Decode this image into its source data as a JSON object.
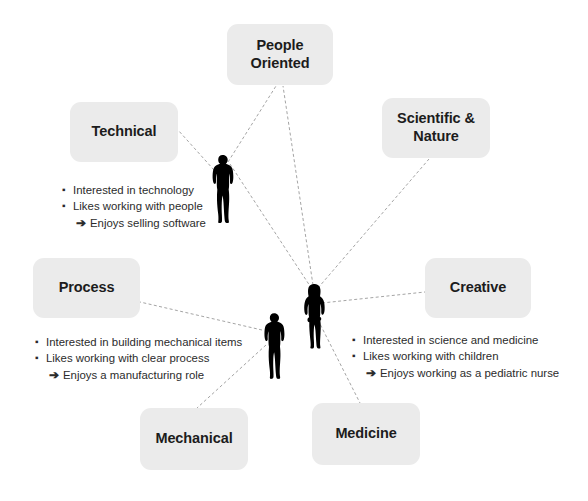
{
  "diagram": {
    "background_color": "#ffffff",
    "node_fill": "#ebebeb",
    "node_text_color": "#1c1c1c",
    "edge_color": "#9a9a9a",
    "figure_color": "#000000",
    "nodes": [
      {
        "id": "people-oriented",
        "label": "People\nOriented",
        "x": 227,
        "y": 24,
        "w": 106,
        "h": 61
      },
      {
        "id": "technical",
        "label": "Technical",
        "x": 70,
        "y": 102,
        "w": 108,
        "h": 60
      },
      {
        "id": "scientific-nature",
        "label": "Scientific &\nNature",
        "x": 382,
        "y": 98,
        "w": 108,
        "h": 60
      },
      {
        "id": "process",
        "label": "Process",
        "x": 33,
        "y": 258,
        "w": 107,
        "h": 60
      },
      {
        "id": "creative",
        "label": "Creative",
        "x": 425,
        "y": 258,
        "w": 106,
        "h": 60
      },
      {
        "id": "mechanical",
        "label": "Mechanical",
        "x": 140,
        "y": 408,
        "w": 108,
        "h": 62
      },
      {
        "id": "medicine",
        "label": "Medicine",
        "x": 312,
        "y": 403,
        "w": 108,
        "h": 62
      }
    ],
    "figures": [
      {
        "id": "man-top",
        "kind": "man",
        "x": 208,
        "y": 154,
        "w": 28,
        "h": 70
      },
      {
        "id": "man-bottom",
        "kind": "man",
        "x": 260,
        "y": 311,
        "w": 27,
        "h": 70
      },
      {
        "id": "woman",
        "kind": "woman",
        "x": 301,
        "y": 282,
        "w": 27,
        "h": 69
      }
    ],
    "edges": [
      {
        "id": "man-top-to-people",
        "x1": 228,
        "y1": 162,
        "x2": 276,
        "y2": 86
      },
      {
        "id": "man-top-to-technical",
        "x1": 214,
        "y1": 170,
        "x2": 178,
        "y2": 130
      },
      {
        "id": "man-top-to-woman-area",
        "x1": 230,
        "y1": 164,
        "x2": 310,
        "y2": 286
      },
      {
        "id": "woman-to-people",
        "x1": 313,
        "y1": 285,
        "x2": 283,
        "y2": 86
      },
      {
        "id": "woman-to-scientific",
        "x1": 318,
        "y1": 288,
        "x2": 429,
        "y2": 159
      },
      {
        "id": "woman-to-creative",
        "x1": 322,
        "y1": 303,
        "x2": 425,
        "y2": 292
      },
      {
        "id": "woman-to-medicine",
        "x1": 318,
        "y1": 320,
        "x2": 360,
        "y2": 403
      },
      {
        "id": "man-bottom-to-process",
        "x1": 262,
        "y1": 330,
        "x2": 140,
        "y2": 302
      },
      {
        "id": "man-bottom-to-mechanical",
        "x1": 266,
        "y1": 345,
        "x2": 197,
        "y2": 408
      }
    ],
    "note_blocks": [
      {
        "id": "technical-notes",
        "x": 62,
        "y": 182,
        "lines": [
          {
            "type": "bullet",
            "text": "Interested in technology"
          },
          {
            "type": "bullet",
            "text": "Likes working with people"
          },
          {
            "type": "conclusion",
            "text": "Enjoys selling software"
          }
        ]
      },
      {
        "id": "process-notes",
        "x": 35,
        "y": 334,
        "lines": [
          {
            "type": "bullet",
            "text": "Interested in building mechanical items"
          },
          {
            "type": "bullet",
            "text": "Likes working with clear process"
          },
          {
            "type": "conclusion",
            "text": "Enjoys a manufacturing role"
          }
        ]
      },
      {
        "id": "medicine-notes",
        "x": 352,
        "y": 332,
        "lines": [
          {
            "type": "bullet",
            "text": "Interested in science and medicine"
          },
          {
            "type": "bullet",
            "text": "Likes working with children"
          },
          {
            "type": "conclusion",
            "text": "Enjoys working as a pediatric nurse"
          }
        ]
      }
    ],
    "glyphs": {
      "bullet": "▪",
      "arrow": "➔"
    }
  }
}
